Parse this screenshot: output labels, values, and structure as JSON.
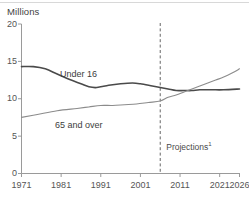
{
  "chart_data": {
    "type": "line",
    "title": "",
    "ylabel": "Millions",
    "xlabel": "",
    "ylim": [
      0,
      20
    ],
    "xlim": [
      1971,
      2026
    ],
    "grid": false,
    "legend_position": "inline-annotation",
    "y_ticks": [
      "20",
      "15",
      "10",
      "5",
      "0"
    ],
    "y_tick_values": [
      20,
      15,
      10,
      5,
      0
    ],
    "x_ticks": [
      "1971",
      "1981",
      "1991",
      "2001",
      "2011",
      "2021",
      "2026"
    ],
    "x_tick_values": [
      1971,
      1981,
      1991,
      2001,
      2011,
      2021,
      2026
    ],
    "annotations": [
      {
        "text": "Projections",
        "superscript": "1",
        "x": 2006
      }
    ],
    "projection_start_year": 2006,
    "series": [
      {
        "name": "Under 16",
        "color": "#4a4a4a",
        "width": 1.6,
        "x": [
          1971,
          1974,
          1977,
          1980,
          1983,
          1986,
          1988,
          1990,
          1993,
          1996,
          1999,
          2001,
          2004,
          2006,
          2008,
          2010,
          2012,
          2014,
          2016,
          2019,
          2022,
          2026
        ],
        "values": [
          14.3,
          14.3,
          14.0,
          13.3,
          12.6,
          12.0,
          11.6,
          11.5,
          11.8,
          12.0,
          12.1,
          12.0,
          11.7,
          11.5,
          11.3,
          11.1,
          11.1,
          11.1,
          11.2,
          11.2,
          11.2,
          11.3
        ]
      },
      {
        "name": "65 and over",
        "color": "#8c8c8c",
        "width": 1.15,
        "x": [
          1971,
          1975,
          1980,
          1985,
          1988,
          1991,
          1994,
          1997,
          2000,
          2003,
          2006,
          2008,
          2010,
          2012,
          2014,
          2016,
          2018,
          2020,
          2022,
          2024,
          2026
        ],
        "values": [
          7.5,
          7.9,
          8.4,
          8.7,
          8.9,
          9.1,
          9.1,
          9.2,
          9.3,
          9.5,
          9.7,
          10.2,
          10.5,
          10.9,
          11.3,
          11.7,
          12.1,
          12.5,
          12.9,
          13.4,
          14.0
        ]
      }
    ],
    "series_labels": [
      {
        "text": "Under 16",
        "left": 60,
        "top": 69
      },
      {
        "text": "65 and over",
        "left": 55,
        "top": 120
      }
    ]
  }
}
